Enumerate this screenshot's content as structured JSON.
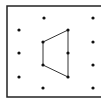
{
  "diagram": {
    "type": "dot-grid-geoboard",
    "frame": {
      "x": 7,
      "y": 6,
      "width": 100,
      "height": 91,
      "stroke": "#222222"
    },
    "dot_color": "#111111",
    "line_color": "#333333",
    "dots": [
      {
        "x": 44,
        "y": 18
      },
      {
        "x": 93,
        "y": 18
      },
      {
        "x": 19,
        "y": 30
      },
      {
        "x": 68,
        "y": 30
      },
      {
        "x": 43,
        "y": 42
      },
      {
        "x": 93,
        "y": 42
      },
      {
        "x": 19,
        "y": 53
      },
      {
        "x": 68,
        "y": 53
      },
      {
        "x": 43,
        "y": 65
      },
      {
        "x": 93,
        "y": 65
      },
      {
        "x": 19,
        "y": 77
      },
      {
        "x": 68,
        "y": 77
      },
      {
        "x": 43,
        "y": 88
      },
      {
        "x": 93,
        "y": 88
      }
    ],
    "polygon": {
      "shape": "quadrilateral",
      "vertices": [
        {
          "x": 43,
          "y": 42
        },
        {
          "x": 68,
          "y": 30
        },
        {
          "x": 68,
          "y": 77
        },
        {
          "x": 43,
          "y": 65
        }
      ]
    }
  }
}
